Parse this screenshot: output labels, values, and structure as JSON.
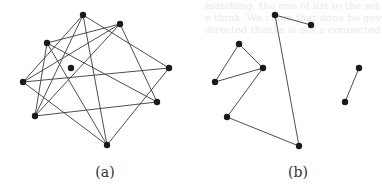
{
  "ghost_text": [
    "matching, the one of list to the set of copies. The algorithm has",
    "e think. We claim that done be governed to extend the blank",
    "directed thanks is not a connected Sheet"
  ],
  "style": {
    "edge_color": "#3a3a3a",
    "node_color": "#1a1a1a",
    "node_radius": 3.2
  },
  "figures": [
    {
      "id": "a",
      "caption": "(a)",
      "caption_x": 105,
      "nodes": {
        "T": [
          83,
          15
        ],
        "UR": [
          120,
          24
        ],
        "UL": [
          47,
          43
        ],
        "C": [
          71,
          68
        ],
        "R": [
          169,
          68
        ],
        "L": [
          23,
          82
        ],
        "RL": [
          157,
          102
        ],
        "LL": [
          35,
          116
        ],
        "B": [
          107,
          145
        ]
      },
      "edges": [
        [
          "T",
          "L"
        ],
        [
          "T",
          "LL"
        ],
        [
          "T",
          "B"
        ],
        [
          "T",
          "R"
        ],
        [
          "UR",
          "UL"
        ],
        [
          "UR",
          "L"
        ],
        [
          "UR",
          "LL"
        ],
        [
          "UR",
          "RL"
        ],
        [
          "UL",
          "LL"
        ],
        [
          "UL",
          "RL"
        ],
        [
          "UL",
          "B"
        ],
        [
          "R",
          "L"
        ],
        [
          "R",
          "B"
        ],
        [
          "RL",
          "LL"
        ],
        [
          "L",
          "B"
        ]
      ]
    },
    {
      "id": "b",
      "caption": "(b)",
      "caption_x": 298,
      "nodes": {
        "A": [
          275,
          15
        ],
        "B": [
          311,
          25
        ],
        "C": [
          239,
          44
        ],
        "D": [
          263,
          68
        ],
        "E": [
          215,
          82
        ],
        "F": [
          227,
          117
        ],
        "G": [
          299,
          146
        ],
        "H": [
          359,
          68
        ],
        "I": [
          345,
          102
        ]
      },
      "edges": [
        [
          "A",
          "B"
        ],
        [
          "A",
          "G"
        ],
        [
          "C",
          "D"
        ],
        [
          "C",
          "E"
        ],
        [
          "E",
          "D"
        ],
        [
          "D",
          "F"
        ],
        [
          "F",
          "G"
        ],
        [
          "H",
          "I"
        ]
      ]
    }
  ]
}
